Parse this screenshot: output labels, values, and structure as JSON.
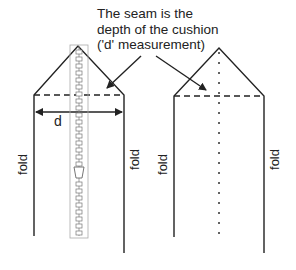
{
  "caption": {
    "lines": [
      "The seam is the",
      "depth of the cushion",
      "('d' measurement)"
    ]
  },
  "labels": {
    "d": "d",
    "fold_left_1": "fold",
    "fold_right_1": "fold",
    "fold_left_2": "fold",
    "fold_right_2": "fold"
  },
  "colors": {
    "line": "#222222",
    "zipper": "#999999"
  }
}
